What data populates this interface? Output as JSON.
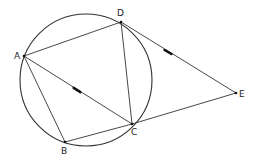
{
  "diagram": {
    "type": "geometry",
    "stroke_color": "#333333",
    "circle": {
      "cx": 86,
      "cy": 80,
      "r": 66
    },
    "points": [
      {
        "id": "A",
        "label": "A",
        "x": 24,
        "y": 56,
        "lx": 14,
        "ly": 59
      },
      {
        "id": "B",
        "label": "B",
        "x": 65,
        "y": 142,
        "lx": 61,
        "ly": 154
      },
      {
        "id": "C",
        "label": "C",
        "x": 132,
        "y": 124,
        "lx": 131,
        "ly": 135
      },
      {
        "id": "D",
        "label": "D",
        "x": 121,
        "y": 22,
        "lx": 117,
        "ly": 16
      },
      {
        "id": "E",
        "label": "E",
        "x": 236,
        "y": 93,
        "lx": 239,
        "ly": 97
      }
    ],
    "segments": [
      {
        "from": "A",
        "to": "D"
      },
      {
        "from": "A",
        "to": "B"
      },
      {
        "from": "A",
        "to": "C"
      },
      {
        "from": "B",
        "to": "C"
      },
      {
        "from": "D",
        "to": "C"
      },
      {
        "from": "D",
        "to": "E"
      },
      {
        "from": "C",
        "to": "E"
      }
    ],
    "parallel_marks": [
      {
        "segment": "A-C",
        "x": 77,
        "y": 90
      },
      {
        "segment": "D-E",
        "x": 168,
        "y": 52
      }
    ]
  }
}
